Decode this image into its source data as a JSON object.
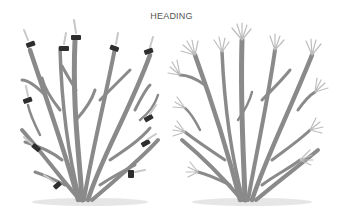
{
  "title": "HEADING",
  "illustration": {
    "subject": "shrub pruning — heading cuts",
    "panels": [
      {
        "name": "before",
        "description": "shrub with heading cuts marked on branch tips"
      },
      {
        "name": "after",
        "description": "shrub regrowth with clusters of new shoots at cut points"
      }
    ]
  },
  "colors": {
    "background": "#ffffff",
    "branch": "#8a8a8a",
    "cut_mark": "#2e2e2e",
    "text": "#555555"
  }
}
